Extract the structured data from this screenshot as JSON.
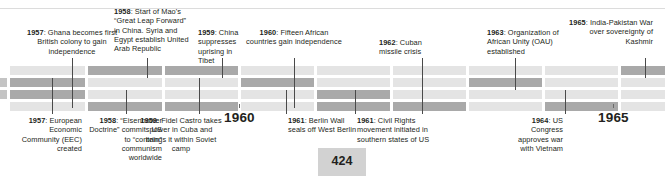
{
  "page": {
    "number": "424",
    "decades": [
      {
        "label": "1960",
        "left": 224,
        "top": 110
      },
      {
        "label": "1965",
        "left": 598,
        "top": 110
      }
    ]
  },
  "timeline": {
    "above_events": [
      {
        "year": "1957",
        "text": ": Ghana becomes first British colony to gain independence",
        "align": "center",
        "left": 17,
        "top": 28,
        "width": 110,
        "leader_x": 72,
        "leader_top": 58,
        "leader_height": 50
      },
      {
        "year": "1958",
        "text": ": Start of Mao's “Great Leap Forward” in China. Syria and Egypt establish United Arab Republic",
        "align": "left",
        "left": 114,
        "top": 7,
        "width": 78,
        "leader_x": 147,
        "leader_top": 58,
        "leader_height": 20
      },
      {
        "year": "1959",
        "text": ": China suppresses uprising in Tibet",
        "align": "left",
        "left": 198,
        "top": 28,
        "width": 50,
        "leader_x": 222,
        "leader_top": 58,
        "leader_height": 20
      },
      {
        "year": "1960",
        "text": ": Fifteen African countries gain independence",
        "align": "center",
        "left": 245,
        "top": 28,
        "width": 98,
        "leader_x": 294,
        "leader_top": 58,
        "leader_height": 50
      },
      {
        "year": "1962",
        "text": ": Cuban missile crisis",
        "align": "left",
        "left": 379,
        "top": 38,
        "width": 66,
        "leader_x": 422,
        "leader_top": 58,
        "leader_height": 56
      },
      {
        "year": "1963",
        "text": ": Organization of African Unity (OAU) established",
        "align": "left",
        "left": 487,
        "top": 28,
        "width": 88,
        "leader_x": 515,
        "leader_top": 58,
        "leader_height": 32
      },
      {
        "year": "1965",
        "text": ": India-Pakistan War over sovereignty of Kashmir",
        "align": "right",
        "left": 566,
        "top": 18,
        "width": 87,
        "leader_x": 645,
        "leader_top": 58,
        "leader_height": 20
      }
    ],
    "below_events": [
      {
        "year": "1957",
        "text": ": European Economic Community (EEC) created",
        "align": "right",
        "left": 20,
        "top": 116,
        "width": 62,
        "leader_x": 52,
        "leader_top": 78,
        "leader_height": 36
      },
      {
        "year": "1958",
        "text": ": “Eisenhower Doctrine” commits US to “contain” communism worldwide",
        "align": "right",
        "left": 88,
        "top": 116,
        "width": 74,
        "leader_x": 126,
        "leader_top": 90,
        "leader_height": 24
      },
      {
        "year": "1959",
        "text": ": Fidel Castro takes power in Cuba and brings it within Soviet camp",
        "align": "center",
        "left": 140,
        "top": 116,
        "width": 82,
        "leader_x": 199,
        "leader_top": 78,
        "leader_height": 36
      },
      {
        "year": "1961",
        "text": ": Berlin Wall seals off West Berlin",
        "align": "left",
        "left": 288,
        "top": 116,
        "width": 72,
        "leader_x": 286,
        "leader_top": 90,
        "leader_height": 24
      },
      {
        "year": "1961",
        "text": ": Civil Rights movement initiated in southern states of US",
        "align": "left",
        "left": 357,
        "top": 116,
        "width": 80,
        "leader_x": 355,
        "leader_top": 90,
        "leader_height": 24
      },
      {
        "year": "1964",
        "text": ": US Congress approves war with Vietnam",
        "align": "right",
        "left": 504,
        "top": 116,
        "width": 59,
        "leader_x": 565,
        "leader_top": 90,
        "leader_height": 24
      }
    ],
    "columns": [
      {
        "left": 10,
        "width": 75,
        "rows": [
          "light",
          "dark",
          "dark",
          "light"
        ]
      },
      {
        "left": 88,
        "width": 74,
        "rows": [
          "dark",
          "light",
          "light",
          "dark"
        ]
      },
      {
        "left": 165,
        "width": 73,
        "rows": [
          "dark",
          "light",
          "light",
          "dark"
        ]
      },
      {
        "left": 241,
        "width": 73,
        "rows": [
          "light",
          "dark",
          "light",
          "light"
        ]
      },
      {
        "left": 317,
        "width": 73,
        "rows": [
          "light",
          "light",
          "dark",
          "dark"
        ]
      },
      {
        "left": 393,
        "width": 73,
        "rows": [
          "light",
          "light",
          "light",
          "dark"
        ]
      },
      {
        "left": 469,
        "width": 73,
        "rows": [
          "light",
          "dark",
          "light",
          "light"
        ]
      },
      {
        "left": 545,
        "width": 73,
        "rows": [
          "light",
          "light",
          "light",
          "dark"
        ]
      },
      {
        "left": 621,
        "width": 44,
        "rows": [
          "dark",
          "light",
          "light",
          "light"
        ]
      }
    ],
    "colors": {
      "bar_dark": "#a9a9a9",
      "bar_light": "#e4e4e4",
      "leader": "#4a4a4a",
      "text": "#231f20",
      "page_box": "#d2d2d2"
    }
  }
}
